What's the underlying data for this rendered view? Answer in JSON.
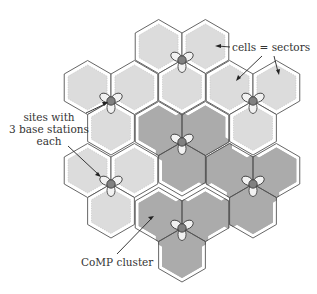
{
  "diagram": {
    "labels": {
      "cells": "cells = sectors",
      "sites_line1": "sites with",
      "sites_line2": "3 base stations",
      "sites_line3": "each",
      "cluster": "CoMP cluster"
    },
    "sites": [
      {
        "id": "site-top",
        "in_cluster": false
      },
      {
        "id": "site-upper-left",
        "in_cluster": false
      },
      {
        "id": "site-upper-right",
        "in_cluster": false
      },
      {
        "id": "site-center",
        "in_cluster": true
      },
      {
        "id": "site-lower-left",
        "in_cluster": false
      },
      {
        "id": "site-lower-right",
        "in_cluster": true
      },
      {
        "id": "site-bottom",
        "in_cluster": true
      }
    ],
    "sectors_per_site": 3,
    "colors": {
      "cell_fill": "#dcdcdc",
      "cluster_fill": "#ababab",
      "cell_edge": "#555555",
      "rim": "#ffffff",
      "site_dot": "#808080",
      "petal_fill": "#f2f2f2"
    }
  }
}
